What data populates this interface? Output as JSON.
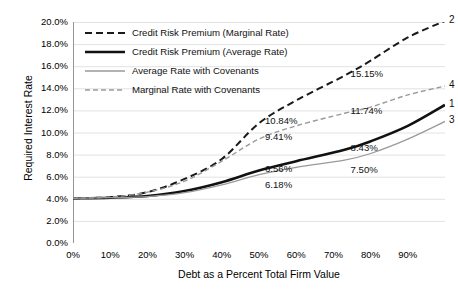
{
  "chart_data": {
    "type": "line",
    "title": "",
    "xlabel": "Debt as a Percent Total Firm Value",
    "ylabel": "Required Interest Rate",
    "xlim": [
      0,
      100
    ],
    "ylim": [
      0,
      20
    ],
    "grid": true,
    "legend_position": "top-left",
    "xticks": [
      "0%",
      "10%",
      "20%",
      "30%",
      "40%",
      "50%",
      "60%",
      "70%",
      "80%",
      "90%"
    ],
    "xtick_values": [
      0,
      10,
      20,
      30,
      40,
      50,
      60,
      70,
      80,
      90
    ],
    "yticks": [
      "0.0%",
      "2.0%",
      "4.0%",
      "6.0%",
      "8.0%",
      "10.0%",
      "12.0%",
      "14.0%",
      "16.0%",
      "18.0%",
      "20.0%"
    ],
    "ytick_values": [
      0,
      2,
      4,
      6,
      8,
      10,
      12,
      14,
      16,
      18,
      20
    ],
    "x": [
      0,
      10,
      20,
      30,
      40,
      50,
      60,
      73,
      80,
      90,
      100
    ],
    "series": [
      {
        "name": "Credit Risk Premium (Marginal Rate)",
        "marker": "2",
        "style": "dashed",
        "color": "#1a1a1a",
        "width": 2.0,
        "values": [
          4.05,
          4.15,
          4.6,
          5.8,
          7.6,
          10.84,
          12.9,
          15.15,
          16.5,
          18.6,
          20.1
        ]
      },
      {
        "name": "Credit Risk Premium (Average Rate)",
        "marker": "1",
        "style": "solid",
        "color": "#111111",
        "width": 2.6,
        "values": [
          4.05,
          4.1,
          4.25,
          4.7,
          5.5,
          6.56,
          7.4,
          8.43,
          9.2,
          10.6,
          12.5
        ]
      },
      {
        "name": "Average Rate with Covenants",
        "marker": "3",
        "style": "solid",
        "color": "#9a9a9a",
        "width": 1.3,
        "values": [
          4.05,
          4.1,
          4.2,
          4.55,
          5.25,
          6.18,
          6.85,
          7.5,
          8.1,
          9.4,
          11.0
        ]
      },
      {
        "name": "Marginal Rate with Covenants",
        "marker": "4",
        "style": "dashed",
        "color": "#9a9a9a",
        "width": 1.4,
        "values": [
          4.05,
          4.15,
          4.6,
          5.6,
          7.4,
          9.41,
          10.6,
          11.74,
          12.3,
          13.4,
          14.2
        ]
      }
    ],
    "annotations": [
      {
        "text": "10.84%",
        "x": 50,
        "y": 10.84,
        "dx": 6,
        "dy": -2
      },
      {
        "text": "9.41%",
        "x": 50,
        "y": 9.41,
        "dx": 6,
        "dy": -2
      },
      {
        "text": "6.56%",
        "x": 50,
        "y": 6.56,
        "dx": 6,
        "dy": -2
      },
      {
        "text": "6.18%",
        "x": 50,
        "y": 6.18,
        "dx": 6,
        "dy": 10
      },
      {
        "text": "15.15%",
        "x": 73,
        "y": 15.15,
        "dx": 6,
        "dy": -2
      },
      {
        "text": "11.74%",
        "x": 73,
        "y": 11.74,
        "dx": 6,
        "dy": -2
      },
      {
        "text": "8.43%",
        "x": 73,
        "y": 8.43,
        "dx": 6,
        "dy": -2
      },
      {
        "text": "7.50%",
        "x": 73,
        "y": 7.5,
        "dx": 6,
        "dy": 10
      }
    ]
  },
  "colors": {
    "axis": "#959595",
    "grid": "#e2e2e2",
    "dark_series": "#111111",
    "light_series": "#9a9a9a",
    "text": "#000000",
    "background": "#ffffff"
  }
}
